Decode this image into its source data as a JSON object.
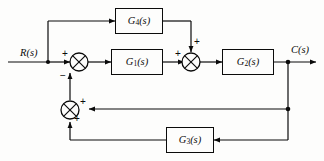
{
  "diagram": {
    "type": "control-system-block-diagram",
    "signals": {
      "input": {
        "label": "R(s)",
        "name": "reference-input"
      },
      "output": {
        "label": "C(s)",
        "name": "controlled-output"
      }
    },
    "blocks": [
      {
        "id": "G4",
        "base": "G",
        "subscript": "4",
        "arg": "(s)",
        "label": "G4(s)",
        "role": "feedforward-path"
      },
      {
        "id": "G1",
        "base": "G",
        "subscript": "1",
        "arg": "(s)",
        "label": "G1(s)",
        "role": "forward-path-first"
      },
      {
        "id": "G2",
        "base": "G",
        "subscript": "2",
        "arg": "(s)",
        "label": "G2(s)",
        "role": "forward-path-second"
      },
      {
        "id": "G3",
        "base": "G",
        "subscript": "3",
        "arg": "(s)",
        "label": "G3(s)",
        "role": "feedback-path"
      }
    ],
    "summing_junctions": [
      {
        "id": "S1",
        "name": "input-summing-junction",
        "signs": [
          {
            "value": "+",
            "position": "left"
          },
          {
            "value": "−",
            "position": "bottom"
          }
        ]
      },
      {
        "id": "S2",
        "name": "forward-summing-junction",
        "signs": [
          {
            "value": "+",
            "position": "left"
          },
          {
            "value": "+",
            "position": "top"
          }
        ]
      },
      {
        "id": "S3",
        "name": "feedback-summing-junction",
        "signs": [
          {
            "value": "+",
            "position": "right-top"
          },
          {
            "value": "+",
            "position": "right-bottom"
          }
        ]
      }
    ],
    "colors": {
      "line": "#0b0b0b",
      "background": "#fdfdfc",
      "text": "#0b0b0b"
    }
  }
}
